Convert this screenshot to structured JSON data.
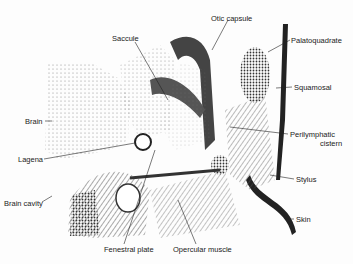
{
  "figure": {
    "type": "anatomical cross-section illustration",
    "labels": [
      {
        "id": "saccule",
        "text": "Saccule",
        "x": 112,
        "y": 35
      },
      {
        "id": "otic-capsule",
        "text": "Otic capsule",
        "x": 211,
        "y": 15
      },
      {
        "id": "palatoquadrate",
        "text": "Palatoquadrate",
        "x": 291,
        "y": 37
      },
      {
        "id": "squamosal",
        "text": "Squamosal",
        "x": 294,
        "y": 84
      },
      {
        "id": "brain",
        "text": "Brain",
        "x": 25,
        "y": 119
      },
      {
        "id": "perilymphatic-cistern-1",
        "text": "Perilymphatic",
        "x": 290,
        "y": 132
      },
      {
        "id": "perilymphatic-cistern-2",
        "text": "cistern",
        "x": 320,
        "y": 141
      },
      {
        "id": "lagena",
        "text": "Lagena",
        "x": 18,
        "y": 157
      },
      {
        "id": "stylus",
        "text": "Stylus",
        "x": 296,
        "y": 177
      },
      {
        "id": "brain-cavity",
        "text": "Brain cavity",
        "x": 4,
        "y": 202
      },
      {
        "id": "skin",
        "text": "Skin",
        "x": 296,
        "y": 217
      },
      {
        "id": "fenestral-plate",
        "text": "Fenestral plate",
        "x": 104,
        "y": 247
      },
      {
        "id": "opercular-muscle",
        "text": "Opercular muscle",
        "x": 173,
        "y": 247
      }
    ]
  }
}
